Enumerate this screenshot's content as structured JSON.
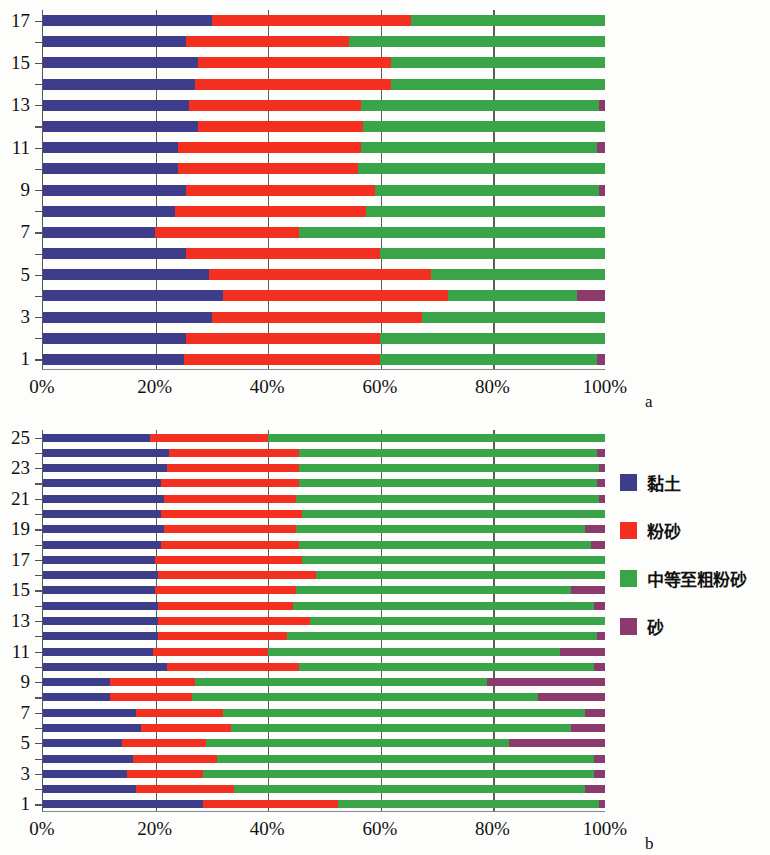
{
  "figure": {
    "panel_a_label": "a",
    "panel_b_label": "b"
  },
  "legend": {
    "items": [
      {
        "label": "黏土",
        "color": "#3d3d8c",
        "key": "clay"
      },
      {
        "label": "粉砂",
        "color": "#f3301f",
        "key": "silt"
      },
      {
        "label": "中等至粗粉砂",
        "color": "#3aa548",
        "key": "medium-coarse-silt"
      },
      {
        "label": "砂",
        "color": "#8c3a6e",
        "key": "sand"
      }
    ]
  },
  "colors": {
    "clay": "#3d3d8c",
    "silt": "#f3301f",
    "medium_coarse_silt": "#3aa548",
    "sand": "#8c3a6e",
    "gridline": "#5d5d5d",
    "axis": "#555555",
    "background": "#fdfdfb"
  },
  "chart_data": [
    {
      "type": "bar",
      "orientation": "horizontal",
      "stacked": true,
      "normalized": true,
      "panel": "a",
      "title": "",
      "xlabel": "",
      "ylabel": "",
      "xlim": [
        0,
        100
      ],
      "xticks": [
        0,
        20,
        40,
        60,
        80,
        100
      ],
      "xticklabels": [
        "0%",
        "20%",
        "40%",
        "60%",
        "80%",
        "100%"
      ],
      "ytick_labels": [
        "1",
        "3",
        "5",
        "7",
        "9",
        "11",
        "13",
        "15",
        "17"
      ],
      "grid": "vertical",
      "legend_position": "right-outside",
      "categories": [
        "1",
        "2",
        "3",
        "4",
        "5",
        "6",
        "7",
        "8",
        "9",
        "10",
        "11",
        "12",
        "13",
        "14",
        "15",
        "16",
        "17"
      ],
      "series": [
        {
          "name": "黏土",
          "color": "#3d3d8c",
          "values": [
            25.0,
            25.5,
            30.0,
            32.0,
            29.5,
            25.5,
            20.0,
            23.5,
            25.5,
            24.0,
            24.0,
            27.5,
            26.0,
            27.0,
            27.5,
            25.5,
            30.0
          ]
        },
        {
          "name": "粉砂",
          "color": "#f3301f",
          "values": [
            35.0,
            34.5,
            37.5,
            40.0,
            39.5,
            34.5,
            25.5,
            34.0,
            33.5,
            32.0,
            32.5,
            29.5,
            30.5,
            35.0,
            34.5,
            29.0,
            35.5
          ]
        },
        {
          "name": "中等至粗粉砂",
          "color": "#3aa548",
          "values": [
            38.5,
            40.0,
            32.5,
            23.0,
            31.0,
            40.0,
            54.5,
            42.5,
            40.0,
            44.0,
            42.0,
            43.0,
            42.5,
            38.0,
            38.0,
            45.5,
            34.5
          ]
        },
        {
          "name": "砂",
          "color": "#8c3a6e",
          "values": [
            1.5,
            0.0,
            0.0,
            5.0,
            0.0,
            0.0,
            0.0,
            0.0,
            1.0,
            0.0,
            1.5,
            0.0,
            1.0,
            0.0,
            0.0,
            0.0,
            0.0
          ]
        }
      ]
    },
    {
      "type": "bar",
      "orientation": "horizontal",
      "stacked": true,
      "normalized": true,
      "panel": "b",
      "title": "",
      "xlabel": "",
      "ylabel": "",
      "xlim": [
        0,
        100
      ],
      "xticks": [
        0,
        20,
        40,
        60,
        80,
        100
      ],
      "xticklabels": [
        "0%",
        "20%",
        "40%",
        "60%",
        "80%",
        "100%"
      ],
      "ytick_labels": [
        "1",
        "3",
        "5",
        "7",
        "9",
        "11",
        "13",
        "15",
        "17",
        "19",
        "21",
        "23",
        "25"
      ],
      "grid": "vertical",
      "legend_position": "right-outside",
      "categories": [
        "1",
        "2",
        "3",
        "4",
        "5",
        "6",
        "7",
        "8",
        "9",
        "10",
        "11",
        "12",
        "13",
        "14",
        "15",
        "16",
        "17",
        "18",
        "19",
        "20",
        "21",
        "22",
        "23",
        "24",
        "25"
      ],
      "series": [
        {
          "name": "黏土",
          "color": "#3d3d8c",
          "values": [
            28.5,
            16.5,
            15.0,
            16.0,
            14.0,
            17.5,
            16.5,
            12.0,
            12.0,
            22.0,
            19.5,
            20.5,
            20.5,
            20.5,
            20.0,
            20.5,
            20.0,
            21.0,
            21.5,
            21.0,
            21.5,
            21.0,
            22.0,
            22.5,
            19.0
          ]
        },
        {
          "name": "粉砂",
          "color": "#f3301f",
          "values": [
            24.0,
            17.5,
            13.5,
            15.0,
            15.0,
            16.0,
            15.5,
            14.5,
            15.0,
            23.5,
            20.5,
            23.0,
            27.0,
            24.0,
            25.0,
            28.0,
            26.0,
            24.5,
            23.5,
            25.0,
            23.5,
            24.5,
            23.5,
            23.0,
            21.0
          ]
        },
        {
          "name": "中等至粗粉砂",
          "color": "#3aa548",
          "values": [
            46.5,
            62.5,
            69.5,
            67.0,
            54.0,
            60.5,
            64.5,
            61.5,
            52.0,
            52.5,
            52.0,
            55.0,
            52.5,
            53.5,
            49.0,
            51.5,
            54.0,
            52.0,
            51.5,
            54.0,
            54.0,
            53.0,
            53.5,
            53.0,
            60.0
          ]
        },
        {
          "name": "砂",
          "color": "#8c3a6e",
          "values": [
            1.0,
            3.5,
            2.0,
            2.0,
            17.0,
            6.0,
            3.5,
            12.0,
            21.0,
            2.0,
            8.0,
            1.5,
            0.0,
            2.0,
            6.0,
            0.0,
            0.0,
            2.5,
            3.5,
            0.0,
            1.0,
            1.5,
            1.0,
            1.5,
            0.0
          ]
        }
      ]
    }
  ]
}
